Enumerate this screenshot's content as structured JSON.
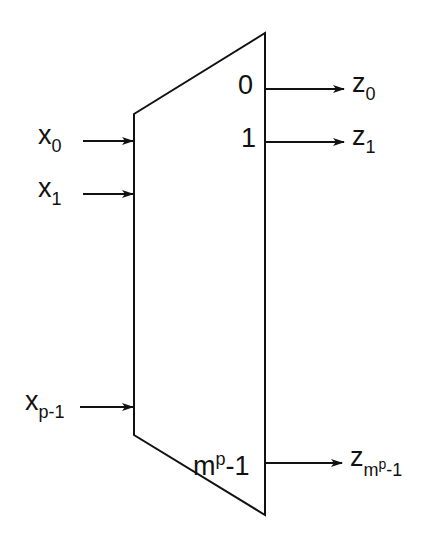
{
  "diagram": {
    "type": "demultiplexer / decoder block",
    "inputs": [
      {
        "base": "x",
        "sub": "0"
      },
      {
        "base": "x",
        "sub": "1"
      },
      {
        "base": "x",
        "sub": "p-1"
      }
    ],
    "port_labels": [
      {
        "text": "0"
      },
      {
        "text": "1"
      },
      {
        "base": "m",
        "sup": "p",
        "rest": "-1"
      }
    ],
    "outputs": [
      {
        "base": "z",
        "sub": "0"
      },
      {
        "base": "z",
        "sub": "1"
      },
      {
        "base": "z",
        "sub_base": "m",
        "sub_sup": "p",
        "sub_rest": "-1"
      }
    ],
    "colors": {
      "line": "#111111",
      "background": "#ffffff"
    }
  }
}
